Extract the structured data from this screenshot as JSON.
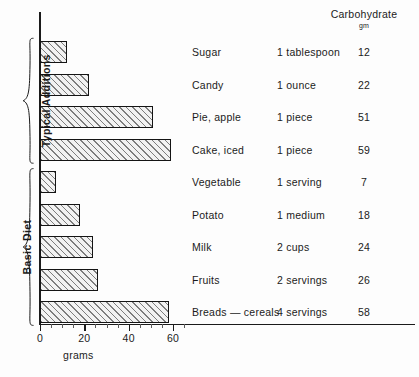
{
  "chart_data": {
    "type": "bar",
    "orientation": "horizontal",
    "title": "",
    "xlabel": "grams",
    "ylabel": "",
    "xlim": [
      0,
      67
    ],
    "xticks": [
      0,
      20,
      40,
      60
    ],
    "xtick_labels": [
      "0",
      "20",
      "40",
      "60"
    ],
    "minor_tick_step": 5,
    "grid": false,
    "legend": "none",
    "value_column_header": "Carbohydrate",
    "value_column_units": "gm",
    "categories": [
      "Sugar",
      "Candy",
      "Pie, apple",
      "Cake, iced",
      "Vegetable",
      "Potato",
      "Milk",
      "Fruits",
      "Breads — cereals"
    ],
    "values": [
      12,
      22,
      51,
      59,
      7,
      18,
      24,
      26,
      58
    ],
    "portions": [
      "1 tablespoon",
      "1 ounce",
      "1 piece",
      "1 piece",
      "1 serving",
      "1 medium",
      "2 cups",
      "2 servings",
      "4 servings"
    ],
    "groups": [
      {
        "label": "Typical Additions",
        "rows": [
          0,
          1,
          2,
          3
        ]
      },
      {
        "label": "Basic Diet",
        "rows": [
          4,
          5,
          6,
          7,
          8
        ]
      }
    ],
    "colors": {
      "bar_fill": "#f2f2f2",
      "bar_hatch": "#7d7d7d",
      "bar_edge": "#141414",
      "axis": "#1b1b1b",
      "text": "#1b1b1b",
      "background": "#fdfdfd"
    }
  },
  "rows": [
    {
      "food": "Sugar",
      "portion": "1 tablespoon",
      "grams": "12"
    },
    {
      "food": "Candy",
      "portion": "1 ounce",
      "grams": "22"
    },
    {
      "food": "Pie, apple",
      "portion": "1 piece",
      "grams": "51"
    },
    {
      "food": "Cake, iced",
      "portion": "1 piece",
      "grams": "59"
    },
    {
      "food": "Vegetable",
      "portion": "1 serving",
      "grams": "7"
    },
    {
      "food": "Potato",
      "portion": "1 medium",
      "grams": "18"
    },
    {
      "food": "Milk",
      "portion": "2 cups",
      "grams": "24"
    },
    {
      "food": "Fruits",
      "portion": "2 servings",
      "grams": "26"
    },
    {
      "food": "Breads — cereals",
      "portion": "4 servings",
      "grams": "58"
    }
  ],
  "header": {
    "carbohydrate": "Carbohydrate",
    "gm": "gm"
  },
  "axis": {
    "title": "grams",
    "ticks": [
      "0",
      "20",
      "40",
      "60"
    ]
  },
  "groups": {
    "typical": "Typical Additions",
    "basic": "Basic Diet"
  }
}
